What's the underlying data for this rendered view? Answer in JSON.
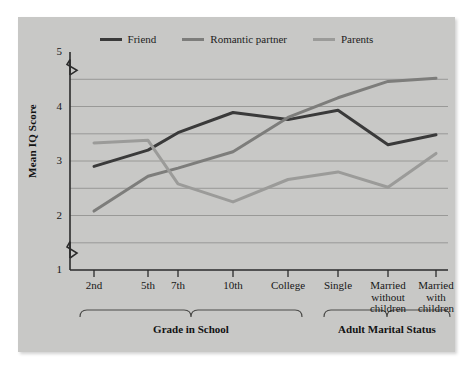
{
  "figure": {
    "background": "#ffffff",
    "panel_color": "#c8c8c6"
  },
  "chart_data": {
    "type": "line",
    "title": "",
    "subtitle": "",
    "xlabel": "",
    "ylabel": "Mean IQ Score",
    "ylim": [
      1,
      5
    ],
    "yticks": [
      1,
      2,
      3,
      4,
      5
    ],
    "ytick_labels": [
      "1",
      "2",
      "3",
      "4",
      "5"
    ],
    "y_axis_breaks": [
      "between 1 and 2",
      "between 4 and 5"
    ],
    "grid": true,
    "grid_axis": "y",
    "legend_position": "top-center",
    "categories": [
      "2nd",
      "5th",
      "7th",
      "10th",
      "College",
      "Single",
      "Married without children",
      "Married with children"
    ],
    "category_groups": [
      {
        "label": "Grade in School",
        "members": [
          "2nd",
          "5th",
          "7th",
          "10th",
          "College"
        ]
      },
      {
        "label": "Adult Marital Status",
        "members": [
          "Single",
          "Married without children",
          "Married with children"
        ]
      }
    ],
    "series": [
      {
        "name": "Friend",
        "color": "#3a3a3a",
        "values": [
          2.9,
          3.2,
          3.52,
          3.89,
          3.76,
          3.93,
          3.3,
          3.48
        ]
      },
      {
        "name": "Romantic partner",
        "color": "#7d7d7b",
        "values": [
          2.08,
          2.72,
          2.87,
          3.17,
          3.8,
          4.16,
          4.46,
          4.52
        ]
      },
      {
        "name": "Parents",
        "color": "#9b9b99",
        "values": [
          3.33,
          3.38,
          2.58,
          2.25,
          2.66,
          2.8,
          2.52,
          3.14
        ]
      }
    ]
  },
  "legend": {
    "entries": [
      {
        "label": "Friend",
        "color": "#3a3a3a"
      },
      {
        "label": "Romantic partner",
        "color": "#7d7d7b"
      },
      {
        "label": "Parents",
        "color": "#9b9b99"
      }
    ]
  },
  "axes": {
    "y_title": "Mean IQ Score",
    "y_ticks": [
      "5",
      "4",
      "3",
      "2",
      "1"
    ],
    "x_ticks": [
      {
        "lines": [
          "2nd"
        ]
      },
      {
        "lines": [
          "5th"
        ]
      },
      {
        "lines": [
          "7th"
        ]
      },
      {
        "lines": [
          "10th"
        ]
      },
      {
        "lines": [
          "College"
        ]
      },
      {
        "lines": [
          "Single"
        ]
      },
      {
        "lines": [
          "Married",
          "without",
          "children"
        ]
      },
      {
        "lines": [
          "Married",
          "with",
          "children"
        ]
      }
    ]
  },
  "groups": [
    {
      "label": "Grade in School"
    },
    {
      "label": "Adult Marital Status"
    }
  ]
}
